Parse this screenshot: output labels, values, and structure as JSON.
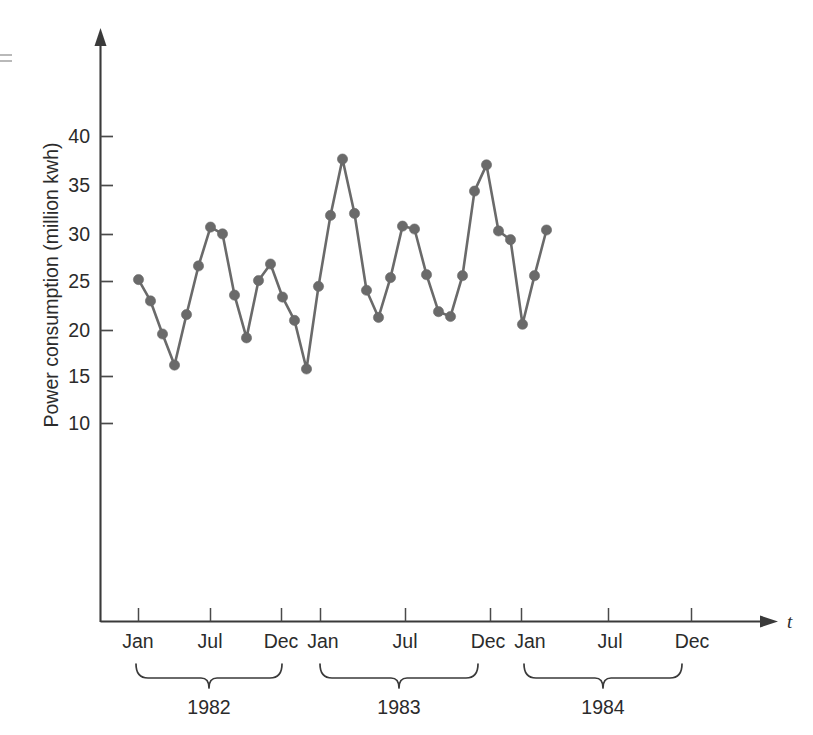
{
  "figure": {
    "caption_present": false,
    "background_color": "#ffffff",
    "ink_color": "#2b2b2b",
    "series_color": "#6a6a6a"
  },
  "chart_data": {
    "type": "line",
    "title": "",
    "xlabel": "t",
    "ylabel": "Power consumption (million kwh)",
    "ylim": [
      0,
      45
    ],
    "yticks": [
      10,
      15,
      20,
      25,
      30,
      35,
      40
    ],
    "ytick_labels": [
      "10",
      "15",
      "20",
      "25",
      "30",
      "35",
      "40"
    ],
    "grid": false,
    "legend": "none",
    "marker": "circle",
    "x_axis_arrow": true,
    "y_axis_arrow": true,
    "x": [
      "1982-01",
      "1982-02",
      "1982-03",
      "1982-04",
      "1982-05",
      "1982-06",
      "1982-07",
      "1982-08",
      "1982-09",
      "1982-10",
      "1982-11",
      "1982-12",
      "1983-01",
      "1983-02",
      "1983-03",
      "1983-04",
      "1983-05",
      "1983-06",
      "1983-07",
      "1983-08",
      "1983-09",
      "1983-10",
      "1983-11",
      "1983-12",
      "1984-01",
      "1984-02",
      "1984-03",
      "1984-04",
      "1984-05",
      "1984-06",
      "1984-07",
      "1984-08",
      "1984-09",
      "1984-10",
      "1984-11"
    ],
    "values": [
      25.2,
      23.0,
      19.6,
      16.4,
      21.6,
      26.6,
      30.6,
      29.9,
      23.6,
      19.2,
      25.1,
      26.8,
      23.4,
      21.0,
      16.0,
      24.5,
      31.8,
      37.6,
      32.0,
      24.1,
      21.3,
      25.4,
      30.7,
      30.4,
      25.7,
      21.9,
      21.4,
      25.6,
      34.3,
      37.0,
      30.2,
      29.3,
      20.6,
      25.6,
      30.3
    ],
    "xtick_labels": [
      "Jan",
      "Jul",
      "Dec",
      "Jan",
      "Jul",
      "Dec",
      "Jan",
      "Jul",
      "Dec"
    ],
    "group_labels": [
      "1982",
      "1983",
      "1984"
    ]
  },
  "y_axis": {
    "title": "Power consumption (million kwh)",
    "ticks": [
      "40",
      "35",
      "30",
      "25",
      "20",
      "15",
      "10"
    ]
  },
  "x_axis": {
    "title": "t",
    "month_ticks": [
      "Jan",
      "Jul",
      "Dec",
      "Jan",
      "Jul",
      "Dec",
      "Jan",
      "Jul",
      "Dec"
    ],
    "year_groups": [
      {
        "label": "1982"
      },
      {
        "label": "1983"
      },
      {
        "label": "1984"
      }
    ]
  }
}
